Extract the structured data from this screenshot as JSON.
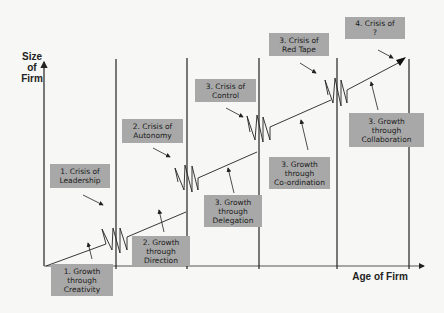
{
  "diagram": {
    "y_axis_label": "Size\nof\nFirm",
    "x_axis_label": "Age of Firm",
    "colors": {
      "box_fill": "#a8a8a8",
      "line": "#222222",
      "background": "#f7f7f5"
    },
    "crises": [
      {
        "label": "1. Crisis of\nLeadership"
      },
      {
        "label": "2. Crisis of\nAutonomy"
      },
      {
        "label": "3. Crisis of\nControl"
      },
      {
        "label": "3. Crisis of\nRed Tape"
      },
      {
        "label": "4. Crisis of\n?"
      }
    ],
    "growth_phases": [
      {
        "label": "1. Growth\nthrough\nCreativity"
      },
      {
        "label": "2. Growth\nthrough\nDirection"
      },
      {
        "label": "3. Growth\nthrough\nDelegation"
      },
      {
        "label": "3. Growth\nthrough\nCo-ordination"
      },
      {
        "label": "3. Growth\nthrough\nCollaboration"
      }
    ]
  }
}
